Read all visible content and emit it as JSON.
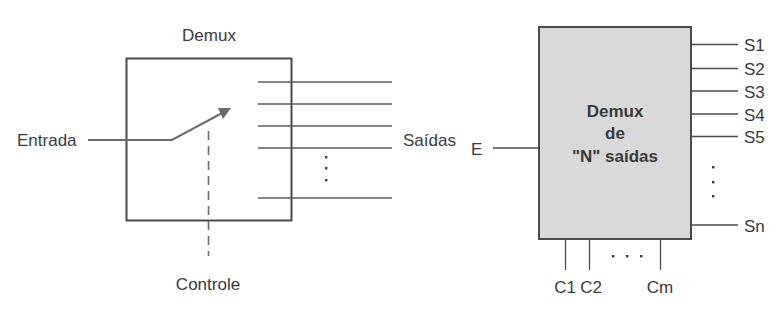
{
  "left_diagram": {
    "title": "Demux",
    "input_label": "Entrada",
    "output_label": "Saídas",
    "control_label": "Controle",
    "ellipsis": "⋮"
  },
  "right_diagram": {
    "block_text": [
      "Demux",
      "de",
      "\"N\" saídas"
    ],
    "input_label": "E",
    "outputs": [
      "S1",
      "S2",
      "S3",
      "S4",
      "S5",
      "Sn"
    ],
    "controls": [
      "C1",
      "C2",
      "Cm"
    ],
    "output_ellipsis": "⋮",
    "control_ellipsis": "· · ·"
  },
  "colors": {
    "stroke": "#4a4a4a",
    "text": "#3a3a3a",
    "block_fill": "#d9d9d9",
    "arrow": "#6b6b6b"
  }
}
